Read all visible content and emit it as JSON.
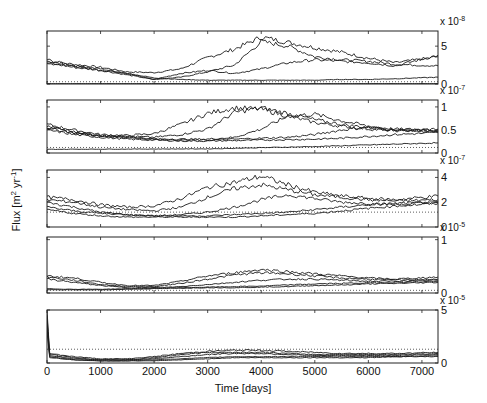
{
  "chart_data": {
    "type": "line",
    "layout": "5 vertically stacked panels sharing x-axis, y-axis ticks on right",
    "xlabel": "Time [days]",
    "ylabel": "Flux [m^2 yr^-1]",
    "xlim": [
      0,
      7300
    ],
    "xticks": [
      0,
      1000,
      2000,
      3000,
      4000,
      5000,
      6000,
      7000
    ],
    "grid": false,
    "legend": null,
    "panels": [
      {
        "multiplier": "x 10^-8",
        "multiplier_exp": "-8",
        "ylim": [
          0,
          7
        ],
        "yticks": [
          0,
          5
        ],
        "dotted_reference": 0.3,
        "series": [
          {
            "name": "run1",
            "x": [
              0,
              500,
              1000,
              1500,
              2000,
              2500,
              3000,
              3500,
              4000,
              4500,
              5000,
              5500,
              6000,
              6500,
              7300
            ],
            "values": [
              3.0,
              2.6,
              2.2,
              1.6,
              1.5,
              2.0,
              3.5,
              4.6,
              6.2,
              5.5,
              4.8,
              4.2,
              3.4,
              2.8,
              3.6
            ]
          },
          {
            "name": "run2",
            "x": [
              0,
              500,
              1000,
              1500,
              2000,
              2500,
              3000,
              3500,
              4000,
              4500,
              5000,
              5500,
              6000,
              6500,
              7300
            ],
            "values": [
              3.2,
              2.4,
              2.0,
              1.4,
              0.6,
              0.9,
              1.6,
              2.5,
              5.6,
              5.0,
              3.6,
              3.2,
              3.0,
              2.6,
              2.4
            ]
          },
          {
            "name": "run3",
            "x": [
              0,
              500,
              1000,
              1500,
              2000,
              2500,
              3000,
              3500,
              4000,
              4500,
              5000,
              5500,
              6000,
              6500,
              7300
            ],
            "values": [
              2.8,
              2.2,
              1.8,
              1.2,
              0.6,
              1.4,
              1.8,
              1.4,
              2.0,
              2.8,
              3.2,
              3.0,
              2.8,
              2.4,
              3.8
            ]
          },
          {
            "name": "run4",
            "x": [
              0,
              500,
              1000,
              1500,
              2000,
              2500,
              3000,
              3500,
              4000,
              4500,
              5000,
              5500,
              6000,
              6500,
              7300
            ],
            "values": [
              2.6,
              2.4,
              1.8,
              1.4,
              0.8,
              0.6,
              0.5,
              0.5,
              0.5,
              0.5,
              0.5,
              0.6,
              0.6,
              0.7,
              0.9
            ]
          },
          {
            "name": "run5",
            "x": [
              0,
              7300
            ],
            "values": [
              0.05,
              0.05
            ]
          }
        ]
      },
      {
        "multiplier": "x 10^-7",
        "multiplier_exp": "-7",
        "ylim": [
          0,
          1.15
        ],
        "yticks": [
          0,
          0.5,
          1
        ],
        "dotted_reference": 0.12,
        "series": [
          {
            "name": "run1",
            "x": [
              0,
              500,
              1000,
              1500,
              2000,
              2500,
              3000,
              3500,
              4000,
              4500,
              5000,
              5500,
              6000,
              6500,
              7300
            ],
            "values": [
              0.62,
              0.5,
              0.4,
              0.38,
              0.42,
              0.62,
              0.86,
              0.98,
              0.95,
              0.8,
              0.66,
              0.58,
              0.52,
              0.48,
              0.52
            ]
          },
          {
            "name": "run2",
            "x": [
              0,
              500,
              1000,
              1500,
              2000,
              2500,
              3000,
              3500,
              4000,
              4500,
              5000,
              5500,
              6000,
              6500,
              7300
            ],
            "values": [
              0.58,
              0.46,
              0.38,
              0.36,
              0.34,
              0.4,
              0.52,
              0.88,
              0.98,
              0.86,
              0.72,
              0.62,
              0.55,
              0.5,
              0.48
            ]
          },
          {
            "name": "run3",
            "x": [
              0,
              500,
              1000,
              1500,
              2000,
              2500,
              3000,
              3500,
              4000,
              4500,
              5000,
              5500,
              6000,
              6500,
              7300
            ],
            "values": [
              0.56,
              0.44,
              0.38,
              0.36,
              0.3,
              0.3,
              0.3,
              0.34,
              0.52,
              0.8,
              0.84,
              0.7,
              0.58,
              0.52,
              0.5
            ]
          },
          {
            "name": "run4",
            "x": [
              0,
              500,
              1000,
              1500,
              2000,
              2500,
              3000,
              3500,
              4000,
              4500,
              5000,
              5500,
              6000,
              6500,
              7300
            ],
            "values": [
              0.54,
              0.44,
              0.36,
              0.34,
              0.3,
              0.28,
              0.28,
              0.3,
              0.32,
              0.34,
              0.4,
              0.5,
              0.56,
              0.5,
              0.46
            ]
          },
          {
            "name": "run5",
            "x": [
              0,
              500,
              1000,
              1500,
              2000,
              2500,
              3000,
              3500,
              4000,
              4500,
              5000,
              5500,
              6000,
              6500,
              7300
            ],
            "values": [
              0.5,
              0.4,
              0.34,
              0.3,
              0.28,
              0.26,
              0.26,
              0.27,
              0.28,
              0.29,
              0.3,
              0.32,
              0.36,
              0.4,
              0.44
            ]
          },
          {
            "name": "run6",
            "x": [
              0,
              3000,
              5000,
              7300
            ],
            "values": [
              0.08,
              0.09,
              0.14,
              0.22
            ]
          }
        ]
      },
      {
        "multiplier": "x 10^-7",
        "multiplier_exp": "-7",
        "ylim": [
          0,
          4.6
        ],
        "yticks": [
          0,
          2,
          4
        ],
        "dotted_reference": 1.2,
        "series": [
          {
            "name": "run1",
            "x": [
              0,
              500,
              1000,
              1500,
              2000,
              2500,
              3000,
              3500,
              4000,
              4500,
              5000,
              5500,
              6000,
              6500,
              7300
            ],
            "values": [
              2.4,
              2.2,
              1.8,
              1.6,
              1.7,
              2.3,
              3.2,
              3.6,
              4.1,
              3.4,
              2.8,
              2.5,
              2.3,
              2.2,
              2.5
            ]
          },
          {
            "name": "run2",
            "x": [
              0,
              500,
              1000,
              1500,
              2000,
              2500,
              3000,
              3500,
              4000,
              4500,
              5000,
              5500,
              6000,
              6500,
              7300
            ],
            "values": [
              2.2,
              2.0,
              1.6,
              1.4,
              1.3,
              1.6,
              2.4,
              3.1,
              3.4,
              3.0,
              2.6,
              2.4,
              2.2,
              2.1,
              2.2
            ]
          },
          {
            "name": "run3",
            "x": [
              0,
              500,
              1000,
              1500,
              2000,
              2500,
              3000,
              3500,
              4000,
              4500,
              5000,
              5500,
              6000,
              6500,
              7300
            ],
            "values": [
              2.0,
              1.6,
              1.2,
              1.0,
              0.9,
              1.0,
              1.2,
              1.6,
              2.2,
              2.6,
              2.3,
              2.0,
              1.9,
              1.8,
              2.0
            ]
          },
          {
            "name": "run4",
            "x": [
              0,
              500,
              1000,
              1500,
              2000,
              2500,
              3000,
              3500,
              4000,
              4500,
              5000,
              5500,
              6000,
              6500,
              7300
            ],
            "values": [
              1.6,
              1.3,
              1.1,
              1.0,
              0.9,
              0.9,
              0.9,
              1.0,
              1.1,
              1.2,
              1.4,
              1.6,
              1.8,
              1.9,
              2.0
            ]
          },
          {
            "name": "run5",
            "x": [
              0,
              500,
              1000,
              1500,
              2000,
              2500,
              3000,
              3500,
              4000,
              4500,
              5000,
              5500,
              6000,
              6500,
              7300
            ],
            "values": [
              1.4,
              1.1,
              0.9,
              0.8,
              0.8,
              0.8,
              0.8,
              0.8,
              0.9,
              1.0,
              1.1,
              1.3,
              1.5,
              1.7,
              1.9
            ]
          }
        ]
      },
      {
        "multiplier": "x 10^-5",
        "multiplier_exp": "-5",
        "ylim": [
          0,
          1.05
        ],
        "yticks": [
          0,
          1
        ],
        "dotted_reference": 0.05,
        "series": [
          {
            "name": "run1",
            "x": [
              0,
              500,
              1000,
              1500,
              2000,
              2500,
              3000,
              3500,
              4000,
              4500,
              5000,
              5500,
              6000,
              6500,
              7300
            ],
            "values": [
              0.32,
              0.28,
              0.2,
              0.14,
              0.14,
              0.22,
              0.32,
              0.38,
              0.44,
              0.4,
              0.36,
              0.32,
              0.28,
              0.26,
              0.3
            ]
          },
          {
            "name": "run2",
            "x": [
              0,
              500,
              1000,
              1500,
              2000,
              2500,
              3000,
              3500,
              4000,
              4500,
              5000,
              5500,
              6000,
              6500,
              7300
            ],
            "values": [
              0.3,
              0.24,
              0.16,
              0.12,
              0.12,
              0.18,
              0.26,
              0.34,
              0.38,
              0.36,
              0.32,
              0.28,
              0.26,
              0.24,
              0.26
            ]
          },
          {
            "name": "run3",
            "x": [
              0,
              500,
              1000,
              1500,
              2000,
              2500,
              3000,
              3500,
              4000,
              4500,
              5000,
              5500,
              6000,
              6500,
              7300
            ],
            "values": [
              0.26,
              0.2,
              0.14,
              0.1,
              0.1,
              0.12,
              0.16,
              0.2,
              0.24,
              0.26,
              0.26,
              0.24,
              0.22,
              0.22,
              0.24
            ]
          },
          {
            "name": "run4",
            "x": [
              0,
              500,
              1000,
              1500,
              2000,
              2500,
              3000,
              3500,
              4000,
              4500,
              5000,
              5500,
              6000,
              6500,
              7300
            ],
            "values": [
              0.08,
              0.07,
              0.07,
              0.08,
              0.09,
              0.1,
              0.11,
              0.12,
              0.13,
              0.15,
              0.17,
              0.18,
              0.19,
              0.2,
              0.22
            ]
          },
          {
            "name": "run5",
            "x": [
              0,
              500,
              1000,
              1500,
              2000,
              2500,
              3000,
              3500,
              4000,
              4500,
              5000,
              5500,
              6000,
              6500,
              7300
            ],
            "values": [
              0.06,
              0.06,
              0.06,
              0.07,
              0.08,
              0.09,
              0.1,
              0.1,
              0.11,
              0.12,
              0.14,
              0.15,
              0.17,
              0.18,
              0.2
            ]
          }
        ]
      },
      {
        "multiplier": "x 10^-5",
        "multiplier_exp": "-5",
        "ylim": [
          0,
          5
        ],
        "yticks": [
          0,
          5
        ],
        "dotted_reference": 1.3,
        "series": [
          {
            "name": "run1",
            "x": [
              0,
              50,
              500,
              1000,
              1500,
              2000,
              2500,
              3000,
              3500,
              4000,
              4500,
              5000,
              5500,
              6000,
              6500,
              7300
            ],
            "values": [
              5.0,
              0.9,
              0.6,
              0.4,
              0.4,
              0.6,
              0.9,
              1.1,
              1.2,
              1.2,
              1.1,
              1.0,
              0.9,
              0.9,
              0.9,
              1.0
            ]
          },
          {
            "name": "run2",
            "x": [
              0,
              50,
              500,
              1000,
              1500,
              2000,
              2500,
              3000,
              3500,
              4000,
              4500,
              5000,
              5500,
              6000,
              6500,
              7300
            ],
            "values": [
              4.5,
              0.8,
              0.5,
              0.3,
              0.3,
              0.5,
              0.8,
              1.0,
              1.0,
              1.0,
              0.9,
              0.8,
              0.8,
              0.8,
              0.8,
              0.9
            ]
          },
          {
            "name": "run3",
            "x": [
              0,
              50,
              500,
              1000,
              1500,
              2000,
              2500,
              3000,
              3500,
              4000,
              4500,
              5000,
              5500,
              6000,
              6500,
              7300
            ],
            "values": [
              4.0,
              0.7,
              0.4,
              0.3,
              0.3,
              0.4,
              0.6,
              0.8,
              0.9,
              0.9,
              0.8,
              0.7,
              0.7,
              0.7,
              0.7,
              0.8
            ]
          },
          {
            "name": "run4",
            "x": [
              0,
              50,
              500,
              1000,
              1500,
              2000,
              2500,
              3000,
              3500,
              4000,
              4500,
              5000,
              5500,
              6000,
              6500,
              7300
            ],
            "values": [
              3.5,
              0.6,
              0.3,
              0.2,
              0.2,
              0.3,
              0.4,
              0.5,
              0.6,
              0.6,
              0.6,
              0.6,
              0.6,
              0.6,
              0.6,
              0.7
            ]
          },
          {
            "name": "run5",
            "x": [
              0,
              50,
              500,
              1000,
              1500,
              2000,
              2500,
              3000,
              3500,
              4000,
              4500,
              5000,
              5500,
              6000,
              6500,
              7300
            ],
            "values": [
              3.0,
              0.5,
              0.3,
              0.2,
              0.2,
              0.2,
              0.3,
              0.4,
              0.5,
              0.5,
              0.5,
              0.5,
              0.5,
              0.5,
              0.6,
              0.6
            ]
          }
        ]
      }
    ]
  },
  "axes": {
    "xlabel": "Time [days]",
    "ylabel_main": "Flux [m",
    "ylabel_sup1": "2",
    "ylabel_mid": " yr",
    "ylabel_sup2": "-1",
    "ylabel_end": "]"
  }
}
